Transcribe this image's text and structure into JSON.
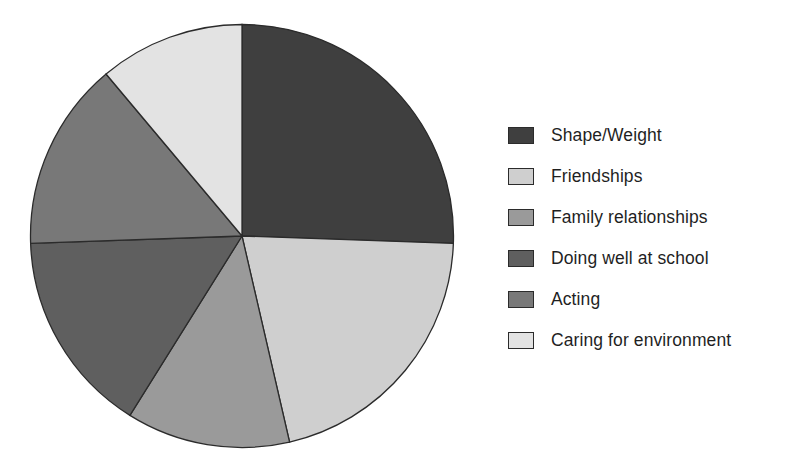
{
  "chart_data": {
    "type": "pie",
    "title": "",
    "subtitle": "",
    "xlabel": "",
    "ylabel": "",
    "grid": false,
    "legend_position": "right",
    "start_angle_deg": 0,
    "direction": "clockwise",
    "categories": [
      "Shape/Weight",
      "Friendships",
      "Family relationships",
      "Doing well at school",
      "Acting",
      "Caring for environment"
    ],
    "values": [
      25.5,
      21.0,
      12.5,
      15.5,
      14.5,
      11.0
    ],
    "value_unit": "percent",
    "slice_angles_deg": [
      92,
      75,
      45,
      56,
      52,
      40
    ],
    "slice_start_angles_deg": [
      0,
      92,
      167,
      212,
      268,
      320
    ],
    "colors": [
      "#3f3f3f",
      "#cfcfcf",
      "#9a9a9a",
      "#5f5f5f",
      "#787878",
      "#e3e3e3"
    ],
    "slice_border_color": "#2b2b2b",
    "annotations": []
  },
  "legend": {
    "items": [
      {
        "label": "Shape/Weight",
        "color": "#3f3f3f"
      },
      {
        "label": "Friendships",
        "color": "#cfcfcf"
      },
      {
        "label": "Family relationships",
        "color": "#9a9a9a"
      },
      {
        "label": "Doing well at school",
        "color": "#5f5f5f"
      },
      {
        "label": "Acting",
        "color": "#787878"
      },
      {
        "label": "Caring for environment",
        "color": "#e3e3e3"
      }
    ]
  }
}
